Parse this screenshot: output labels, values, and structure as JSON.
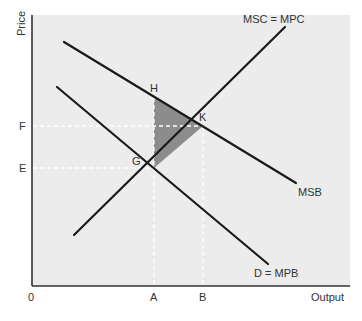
{
  "diagram": {
    "type": "economics-externality",
    "title": "",
    "axes": {
      "y_label": "Price",
      "x_label": "Output",
      "origin_label": "0"
    },
    "y_ticks": [
      {
        "label": "F",
        "y": 126
      },
      {
        "label": "E",
        "y": 168
      }
    ],
    "x_ticks": [
      {
        "label": "A",
        "x": 154
      },
      {
        "label": "B",
        "x": 203
      }
    ],
    "curves": [
      {
        "name": "MSC = MPC",
        "label": "MSC = MPC",
        "from": [
          74,
          235
        ],
        "to": [
          285,
          27
        ]
      },
      {
        "name": "MSB",
        "label": "MSB",
        "from": [
          64,
          42
        ],
        "to": [
          296,
          183
        ]
      },
      {
        "name": "D = MPB",
        "label": "D = MPB",
        "from": [
          57,
          87
        ],
        "to": [
          268,
          264
        ]
      }
    ],
    "points": [
      {
        "label": "H",
        "x": 154,
        "y": 98
      },
      {
        "label": "K",
        "x": 203,
        "y": 126
      },
      {
        "label": "G",
        "x": 154,
        "y": 168
      }
    ],
    "shaded_region": {
      "vertices": [
        "H",
        "K",
        "G"
      ],
      "color": "#8c8c8c"
    },
    "colors": {
      "panel_bg": "#ececec",
      "line": "#1a1a1a",
      "dashed": "#ffffff",
      "text": "#333333"
    }
  }
}
